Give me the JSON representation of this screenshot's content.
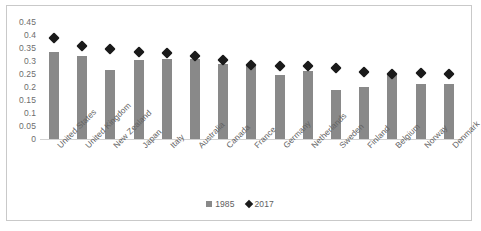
{
  "chart_data": {
    "type": "bar",
    "title": "",
    "subtitle": "",
    "xlabel": "",
    "ylabel": "",
    "ylim": [
      0,
      0.45
    ],
    "y_ticks": [
      "0",
      "0.05",
      "0.1",
      "0.15",
      "0.2",
      "0.25",
      "0.3",
      "0.35",
      "0.4",
      "0.45"
    ],
    "y_tick_values": [
      0,
      0.05,
      0.1,
      0.15,
      0.2,
      0.25,
      0.3,
      0.35,
      0.4,
      0.45
    ],
    "grid": false,
    "legend_position": "bottom",
    "categories": [
      "United States",
      "United Kingdom",
      "New Zealand",
      "Japan",
      "Italy",
      "Australia",
      "Canada",
      "France",
      "Germany",
      "Netherlands",
      "Sweden",
      "Finland",
      "Belgium",
      "Norway",
      "Denmark"
    ],
    "series": [
      {
        "name": "1985",
        "type": "bar",
        "color": "#898989",
        "marker": "square",
        "values": [
          0.334,
          0.318,
          0.265,
          0.303,
          0.306,
          0.308,
          0.287,
          0.285,
          0.245,
          0.263,
          0.19,
          0.2,
          0.25,
          0.211,
          0.21
        ]
      },
      {
        "name": "2017",
        "type": "scatter",
        "color": "#1a1a1a",
        "marker": "diamond",
        "values": [
          0.387,
          0.356,
          0.347,
          0.334,
          0.329,
          0.32,
          0.304,
          0.285,
          0.281,
          0.28,
          0.275,
          0.257,
          0.251,
          0.252,
          0.25
        ]
      }
    ],
    "annotations": []
  },
  "legend": {
    "entries": [
      {
        "label": "1985",
        "swatch": "square-marker"
      },
      {
        "label": "2017",
        "swatch": "diamond-marker"
      }
    ]
  },
  "colors": {
    "bar": "#898989",
    "marker": "#1a1a1a",
    "axis": "#d2d2d2",
    "border": "#c9c9c9",
    "text": "#636363"
  }
}
